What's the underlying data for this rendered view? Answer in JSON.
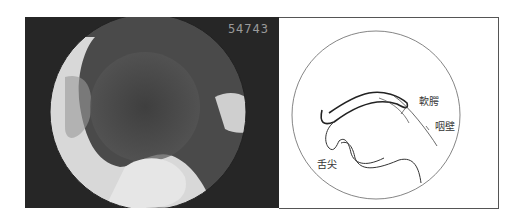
{
  "photo": {
    "counter": "54743",
    "description": "endoscopic view of oral cavity"
  },
  "diagram": {
    "labels": {
      "soft_palate": "軟腭",
      "pharyngeal_wall": "咽壁",
      "tongue_tip": "舌尖"
    }
  }
}
